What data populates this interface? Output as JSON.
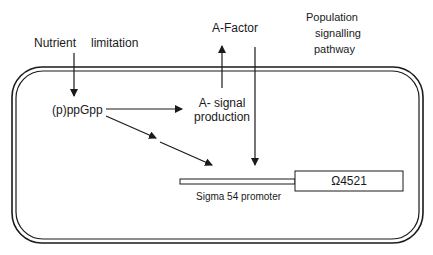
{
  "diagram": {
    "labels": {
      "nutrient": "Nutrient",
      "limitation": "limitation",
      "ppgpp": "(p)ppGpp",
      "a_signal_line1": "A- signal",
      "a_signal_line2": "production",
      "a_factor": "A-Factor",
      "population_line1": "Population",
      "population_line2": "signalling",
      "population_line3": "pathway",
      "promoter": "Sigma 54 promoter",
      "gene": "Ω4521"
    },
    "colors": {
      "stroke": "#1a1a1a",
      "background": "#ffffff"
    }
  }
}
